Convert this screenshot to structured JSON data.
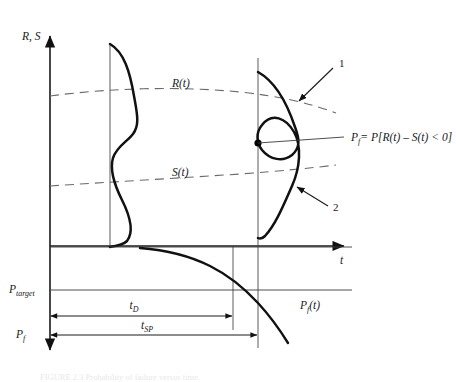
{
  "figure": {
    "domain_kind": "diagram",
    "background_color": "#ffffff",
    "ink_color": "#111111",
    "dash_color": "#6a6a6a",
    "axes": {
      "vertical_top_label": "R, S",
      "horizontal_label": "t",
      "vertical_down_label_lower": "P_f"
    },
    "labels": {
      "r_curve": "R(t)",
      "s_curve": "S(t)",
      "pf_formula_lhs": "P",
      "pf_formula_lhs_sub": "f",
      "pf_formula_rhs": "= P[R(t) – S(t) < 0]",
      "pf_curve_main": "P",
      "pf_curve_sub": "f",
      "pf_curve_tail": "(t)",
      "p_target_main": "P",
      "p_target_sub": "target",
      "p_f_axis_main": "P",
      "p_f_axis_sub": "f",
      "t_d_main": "t",
      "t_d_sub": "D",
      "t_sp_main": "t",
      "t_sp_sub": "SP",
      "rs_axis_main": "R, S",
      "t_axis_main": "t"
    },
    "callouts": [
      {
        "id": "callout-1",
        "text": "1",
        "text_x": 340,
        "text_y": 66,
        "from_x": 333,
        "from_y": 68,
        "to_x": 297,
        "to_y": 103
      },
      {
        "id": "callout-2",
        "text": "2",
        "text_x": 334,
        "text_y": 209,
        "from_x": 328,
        "from_y": 206,
        "to_x": 295,
        "to_y": 185
      }
    ],
    "geometry": {
      "origin_x": 50,
      "origin_y": 246,
      "y_axis_top": 30,
      "y_axis_bottom": 357,
      "x_axis_right": 352,
      "vline_1_x": 110,
      "vline_2_x": 258,
      "dist1_top_y": 44,
      "dist1_bottom_y": 247,
      "dist2_top_y": 72,
      "dist2_bottom_y": 238,
      "cross_dot_x": 258,
      "cross_dot_y": 143,
      "p_target_y": 290,
      "t_d_y": 315,
      "t_sp_y": 334,
      "t_d_end_x": 233,
      "t_sp_end_x": 258
    },
    "caption_faint": "FIGURE 2.3 Probability of failure versus time."
  }
}
